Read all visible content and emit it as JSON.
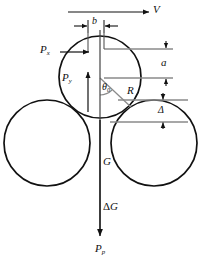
{
  "figure": {
    "background_color": "#ffffff",
    "outline_color": "#111111",
    "leader_color": "#8a8a8a",
    "width": 198,
    "height": 262
  },
  "labels": {
    "velocity": "V",
    "force_x": "P",
    "force_x_sub": "x",
    "force_y": "P",
    "force_y_sub": "y",
    "force_p": "P",
    "force_p_sub": "p",
    "weight": "G",
    "delta_weight_symbol": "Δ",
    "delta_weight": "G",
    "radius": "R",
    "angle": "θ",
    "angle_sub": "0",
    "width_b": "b",
    "height_a": "a",
    "gap_delta": "Δ"
  },
  "geometry": {
    "top_circle": {
      "cx": 100,
      "cy": 77,
      "r": 41
    },
    "left_circle": {
      "cx": 47,
      "cy": 143,
      "r": 43
    },
    "right_circle": {
      "cx": 154,
      "cy": 143,
      "r": 43
    },
    "center_axis_x": 100,
    "center_axis_top_y": 30,
    "center_axis_bottom_y": 236
  },
  "dimensions": {
    "b": {
      "left_x": 88,
      "right_x": 104,
      "y": 26
    },
    "a": {
      "x": 166,
      "top_y": 49,
      "bottom_y": 79
    },
    "delta": {
      "x": 163,
      "top_y": 100,
      "bottom_y": 122
    }
  },
  "vectors": {
    "velocity": {
      "x1": 68,
      "y1": 12,
      "x2": 148,
      "y2": 12,
      "direction": "right"
    },
    "force_x": {
      "x1": 60,
      "y1": 52,
      "x2": 89,
      "y2": 52,
      "direction": "right"
    },
    "force_y": {
      "x1": 88,
      "y1": 112,
      "x2": 88,
      "y2": 73,
      "direction": "up"
    },
    "force_p": {
      "x1": 100,
      "y1": 120,
      "x2": 100,
      "y2": 236,
      "direction": "down"
    },
    "radius": {
      "x1": 100,
      "y1": 78,
      "x2": 131,
      "y2": 106
    }
  }
}
